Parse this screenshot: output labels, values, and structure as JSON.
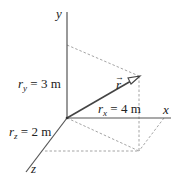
{
  "diagram": {
    "type": "3d-vector-components",
    "axes": {
      "x_label": "x",
      "y_label": "y",
      "z_label": "z"
    },
    "vector": {
      "symbol": "r",
      "arrow_accent": "→"
    },
    "components": {
      "rx": {
        "base": "r",
        "sub": "x",
        "eq": " = 4 m"
      },
      "ry": {
        "base": "r",
        "sub": "y",
        "eq": " = 3 m"
      },
      "rz": {
        "base": "r",
        "sub": "z",
        "eq": " = 2 m"
      }
    },
    "colors": {
      "axis": "#555555",
      "dashed": "#9a9a9a",
      "vector": "#444444",
      "text": "#222222"
    }
  }
}
